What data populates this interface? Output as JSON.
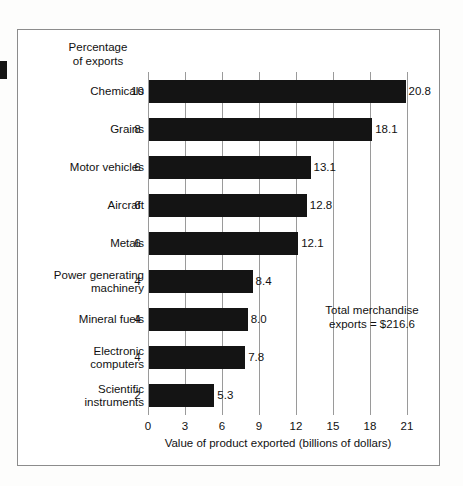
{
  "figure": {
    "edge_mark": "page-bleed-mark"
  },
  "chart_data": {
    "type": "bar",
    "orientation": "horizontal",
    "title": "",
    "xlabel": "Value of product exported (billions of dollars)",
    "ylabel": "",
    "secondary_axis_header": "Percentage\nof exports",
    "secondary_axis_header_line1": "Percentage",
    "secondary_axis_header_line2": "of exports",
    "categories": [
      "Chemicals",
      "Grains",
      "Motor vehicles",
      "Aircraft",
      "Metals",
      "Power generating machinery",
      "Mineral fuels",
      "Electronic computers",
      "Scientific instruments"
    ],
    "values": [
      20.8,
      18.1,
      13.1,
      12.8,
      12.1,
      8.4,
      8.0,
      7.8,
      5.3
    ],
    "value_labels": [
      "20.8",
      "18.1",
      "13.1",
      "12.8",
      "12.1",
      "8.4",
      "8.0",
      "7.8",
      "5.3"
    ],
    "percentage_of_exports": [
      10,
      8,
      6,
      6,
      6,
      4,
      4,
      4,
      2
    ],
    "percentage_labels": [
      "10",
      "8",
      "6",
      "6",
      "6",
      "4",
      "4",
      "4",
      "2"
    ],
    "xlim": [
      0,
      21
    ],
    "xticks": [
      0,
      3,
      6,
      9,
      12,
      15,
      18,
      21
    ],
    "xtick_labels": [
      "0",
      "3",
      "6",
      "9",
      "12",
      "15",
      "18",
      "21"
    ],
    "grid": true,
    "grid_axis": "x",
    "legend": "none",
    "bar_color": "#141414",
    "annotation_line1": "Total merchandise",
    "annotation_line2": "exports  =  $216.6",
    "annotation_total": 216.6
  },
  "rows": [
    {
      "label_line1": "Chemicals",
      "label_line2": "",
      "pct": "10",
      "value": "20.8"
    },
    {
      "label_line1": "Grains",
      "label_line2": "",
      "pct": "8",
      "value": "18.1"
    },
    {
      "label_line1": "Motor vehicles",
      "label_line2": "",
      "pct": "6",
      "value": "13.1"
    },
    {
      "label_line1": "Aircraft",
      "label_line2": "",
      "pct": "6",
      "value": "12.8"
    },
    {
      "label_line1": "Metals",
      "label_line2": "",
      "pct": "6",
      "value": "12.1"
    },
    {
      "label_line1": "Power generating",
      "label_line2": "machinery",
      "pct": "4",
      "value": "8.4"
    },
    {
      "label_line1": "Mineral fuels",
      "label_line2": "",
      "pct": "4",
      "value": "8.0"
    },
    {
      "label_line1": "Electronic",
      "label_line2": "computers",
      "pct": "4",
      "value": "7.8"
    },
    {
      "label_line1": "Scientific",
      "label_line2": "instruments",
      "pct": "2",
      "value": "5.3"
    }
  ],
  "axis": {
    "ticks": [
      "0",
      "3",
      "6",
      "9",
      "12",
      "15",
      "18",
      "21"
    ],
    "title": "Value of product exported (billions of dollars)"
  },
  "annotation": {
    "line1": "Total merchandise",
    "line2": "exports  =  $216.6"
  },
  "header": {
    "line1": "Percentage",
    "line2": "of exports"
  }
}
